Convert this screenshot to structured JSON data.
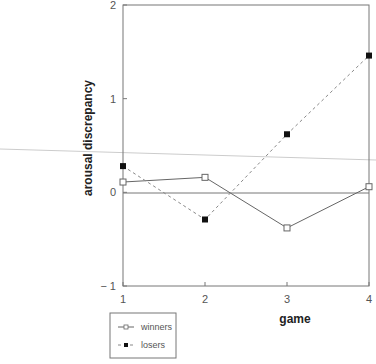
{
  "chart_data": {
    "type": "line",
    "title": "",
    "xlabel": "game",
    "ylabel": "arousal discrepancy",
    "x": [
      1,
      2,
      3,
      4
    ],
    "xticks": [
      "1",
      "2",
      "3",
      "4"
    ],
    "yticks": [
      "-1",
      "0",
      "1",
      "2"
    ],
    "xlim": [
      1,
      4
    ],
    "ylim": [
      -1,
      2
    ],
    "grid": false,
    "zero_line": true,
    "legend_position": "below-left",
    "series": [
      {
        "name": "winners",
        "line": "solid",
        "marker": "open-square",
        "values": [
          0.11,
          0.16,
          -0.38,
          0.06
        ]
      },
      {
        "name": "losers",
        "line": "dashed",
        "marker": "filled-square",
        "values": [
          0.28,
          -0.29,
          0.62,
          1.46
        ]
      }
    ]
  },
  "legend": {
    "items": [
      {
        "label": "winners"
      },
      {
        "label": "losers"
      }
    ]
  },
  "colors": {
    "axis": "#777777",
    "winners": "#666666",
    "losers": "#888888",
    "marker_fill": "#111111",
    "scan_line": "#cccccc"
  }
}
